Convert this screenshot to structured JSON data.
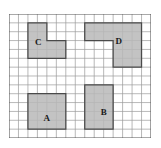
{
  "figure": {
    "grid": {
      "columns": 15,
      "rows": 14,
      "cell_size": 9.4,
      "line_color": "#9a9a9a",
      "border_color": "#555555",
      "origin_x": 9,
      "origin_y": 14
    },
    "style": {
      "shade_color": "#b9b9b9",
      "outline_color": "#4a4a4a",
      "label_color": "#1a1a1a",
      "background": "#ffffff"
    },
    "regions": [
      {
        "label": "C",
        "name": "region-c",
        "area_cells": 8,
        "cells": [
          [
            2,
            1
          ],
          [
            3,
            1
          ],
          [
            2,
            2
          ],
          [
            3,
            2
          ],
          [
            2,
            3
          ],
          [
            3,
            3
          ],
          [
            4,
            3
          ],
          [
            5,
            3
          ],
          [
            2,
            4
          ],
          [
            3,
            4
          ],
          [
            4,
            4
          ],
          [
            5,
            4
          ]
        ],
        "outline_points": "2,1 4,1 4,3 6,3 6,5 2,5",
        "label_cell": [
          2.6,
          2.7
        ]
      },
      {
        "label": "D",
        "name": "region-d",
        "area_cells": 16,
        "cells": [
          [
            8,
            1
          ],
          [
            9,
            1
          ],
          [
            10,
            1
          ],
          [
            11,
            1
          ],
          [
            12,
            1
          ],
          [
            13,
            1
          ],
          [
            8,
            2
          ],
          [
            9,
            2
          ],
          [
            10,
            2
          ],
          [
            11,
            2
          ],
          [
            12,
            2
          ],
          [
            13,
            2
          ],
          [
            10,
            3
          ],
          [
            11,
            3
          ],
          [
            12,
            3
          ],
          [
            13,
            3
          ],
          [
            11,
            4
          ],
          [
            12,
            4
          ],
          [
            13,
            4
          ],
          [
            11,
            5
          ],
          [
            12,
            5
          ],
          [
            13,
            5
          ]
        ],
        "outline_points": "8,1 14,1 14,6 11,6 11,3 8,3",
        "label_cell": [
          11.1,
          2.6
        ]
      },
      {
        "label": "A",
        "name": "region-a",
        "area_cells": 16,
        "cells": [
          [
            2,
            9
          ],
          [
            3,
            9
          ],
          [
            4,
            9
          ],
          [
            5,
            9
          ],
          [
            2,
            10
          ],
          [
            3,
            10
          ],
          [
            4,
            10
          ],
          [
            5,
            10
          ],
          [
            2,
            11
          ],
          [
            3,
            11
          ],
          [
            4,
            11
          ],
          [
            5,
            11
          ],
          [
            2,
            12
          ],
          [
            3,
            12
          ],
          [
            4,
            12
          ],
          [
            5,
            12
          ]
        ],
        "outline_points": "2,9 6,9 6,13 2,13",
        "label_cell": [
          3.5,
          11.3
        ]
      },
      {
        "label": "B",
        "name": "region-b",
        "area_cells": 15,
        "cells": [
          [
            8,
            8
          ],
          [
            9,
            8
          ],
          [
            10,
            8
          ],
          [
            8,
            9
          ],
          [
            9,
            9
          ],
          [
            10,
            9
          ],
          [
            8,
            10
          ],
          [
            9,
            10
          ],
          [
            10,
            10
          ],
          [
            8,
            11
          ],
          [
            9,
            11
          ],
          [
            10,
            11
          ],
          [
            8,
            12
          ],
          [
            9,
            12
          ],
          [
            10,
            12
          ]
        ],
        "outline_points": "8,8 11,8 11,13 8,13",
        "label_cell": [
          9.5,
          10.6
        ]
      }
    ]
  }
}
